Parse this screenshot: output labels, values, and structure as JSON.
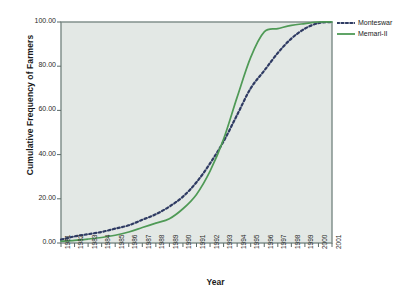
{
  "chart_data": {
    "type": "line",
    "title": "",
    "xlabel": "Year",
    "ylabel": "Cumulative Frequency of Farmers",
    "x": [
      1981,
      1982,
      1983,
      1984,
      1985,
      1986,
      1987,
      1988,
      1989,
      1990,
      1991,
      1992,
      1993,
      1994,
      1995,
      1996,
      1997,
      1998,
      1999,
      2000,
      2001
    ],
    "xlim": [
      1981,
      2001
    ],
    "ylim": [
      0,
      100
    ],
    "yticks": [
      "0.00",
      "20.00",
      "40.00",
      "60.00",
      "80.00",
      "100.00"
    ],
    "ytick_values": [
      0,
      20,
      40,
      60,
      80,
      100
    ],
    "xticks": [
      "1981",
      "1982",
      "1983",
      "1984",
      "1985",
      "1986",
      "1987",
      "1988",
      "1989",
      "1990",
      "1991",
      "1992",
      "1993",
      "1994",
      "1995",
      "1996",
      "1997",
      "1998",
      "1999",
      "2000",
      "2001"
    ],
    "grid": false,
    "legend_position": "upper-right-outside",
    "plot_background": "#e3e8e5",
    "series": [
      {
        "name": "Monteswar",
        "color": "#2f3b63",
        "style": "dotted",
        "values": [
          1.5,
          3.0,
          4.0,
          5.0,
          6.5,
          8.0,
          10.5,
          13.0,
          16.5,
          21.0,
          27.5,
          36.0,
          46.0,
          58.0,
          70.0,
          78.0,
          86.0,
          92.5,
          97.0,
          99.5,
          100.0
        ]
      },
      {
        "name": "Memari-II",
        "color": "#4f9a56",
        "style": "solid",
        "values": [
          0.8,
          1.2,
          1.8,
          2.5,
          3.5,
          5.0,
          7.0,
          9.0,
          11.0,
          15.5,
          22.0,
          32.5,
          47.0,
          66.0,
          84.0,
          95.5,
          97.0,
          98.5,
          99.3,
          100.0,
          100.0
        ]
      }
    ]
  },
  "legend": {
    "items": [
      {
        "label": "Monteswar"
      },
      {
        "label": "Memari-II"
      }
    ]
  },
  "axes": {
    "y_title": "Cumulative Frequency of Farmers",
    "x_title": "Year"
  }
}
